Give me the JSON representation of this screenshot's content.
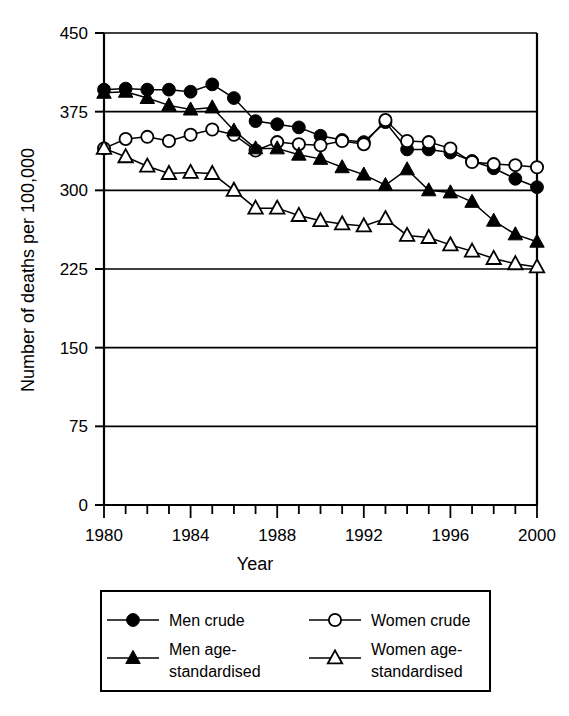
{
  "chart_data": {
    "type": "line",
    "title": "",
    "xlabel": "Year",
    "ylabel": "Number of deaths per 100,000",
    "xlim": [
      1980,
      2000
    ],
    "ylim": [
      0,
      450
    ],
    "yticks": [
      0,
      75,
      150,
      225,
      300,
      375,
      450
    ],
    "ytick_labels": [
      "0",
      "75",
      "150",
      "225",
      "300",
      "375",
      "450"
    ],
    "xticks": [
      1980,
      1981,
      1982,
      1983,
      1984,
      1985,
      1986,
      1987,
      1988,
      1989,
      1990,
      1991,
      1992,
      1993,
      1994,
      1995,
      1996,
      1997,
      1998,
      1999,
      2000
    ],
    "xtick_labels": [
      "1980",
      "",
      "",
      "",
      "1984",
      "",
      "",
      "",
      "1988",
      "",
      "",
      "",
      "1992",
      "",
      "",
      "",
      "1996",
      "",
      "",
      "",
      "2000"
    ],
    "grid": "horizontal",
    "legend_position": "bottom",
    "x": [
      1980,
      1981,
      1982,
      1983,
      1984,
      1985,
      1986,
      1987,
      1988,
      1989,
      1990,
      1991,
      1992,
      1993,
      1994,
      1995,
      1996,
      1997,
      1998,
      1999,
      2000
    ],
    "series": [
      {
        "name": "Men crude",
        "marker": "filled-circle",
        "values": [
          396,
          397,
          396,
          396,
          394,
          401,
          388,
          366,
          363,
          360,
          352,
          348,
          346,
          365,
          339,
          339,
          336,
          328,
          321,
          311,
          303
        ]
      },
      {
        "name": "Women crude",
        "marker": "open-circle",
        "values": [
          340,
          349,
          351,
          347,
          353,
          358,
          353,
          338,
          346,
          344,
          343,
          347,
          344,
          367,
          347,
          346,
          340,
          327,
          325,
          324,
          322
        ]
      },
      {
        "name": "Men age-standardised",
        "marker": "filled-triangle",
        "values": [
          393,
          394,
          388,
          381,
          377,
          379,
          357,
          340,
          340,
          334,
          330,
          322,
          315,
          305,
          320,
          300,
          298,
          289,
          271,
          258,
          251
        ]
      },
      {
        "name": "Women age-standardised",
        "marker": "open-triangle",
        "values": [
          340,
          332,
          323,
          316,
          317,
          316,
          300,
          283,
          283,
          276,
          271,
          268,
          266,
          273,
          257,
          255,
          248,
          242,
          235,
          230,
          227
        ]
      }
    ]
  },
  "legend": {
    "entries": [
      {
        "label": "Men crude",
        "marker": "filled-circle"
      },
      {
        "label": "Women crude",
        "marker": "open-circle"
      },
      {
        "label_line1": "Men age-",
        "label_line2": "standardised",
        "marker": "filled-triangle"
      },
      {
        "label_line1": "Women age-",
        "label_line2": "standardised",
        "marker": "open-triangle"
      }
    ]
  },
  "colors": {
    "ink": "#000000",
    "background": "#ffffff"
  }
}
